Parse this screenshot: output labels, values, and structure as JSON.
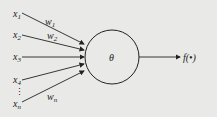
{
  "diagram": {
    "type": "neuron-model",
    "inputs": [
      {
        "label": "x",
        "sub": "1",
        "y": 14
      },
      {
        "label": "x",
        "sub": "2",
        "y": 35
      },
      {
        "label": "x",
        "sub": "3",
        "y": 57
      },
      {
        "label": "x",
        "sub": "4",
        "y": 80
      },
      {
        "label": "x",
        "sub": "n",
        "y": 104
      }
    ],
    "ellipsis": "⋮",
    "weights": [
      {
        "label": "w",
        "sub": "1"
      },
      {
        "label": "w",
        "sub": "2"
      },
      {
        "label": "w",
        "sub": "n"
      }
    ],
    "node_label": "θ",
    "output_label": "f(•)",
    "colors": {
      "background": "#e9e9e7",
      "stroke": "#222222"
    }
  }
}
